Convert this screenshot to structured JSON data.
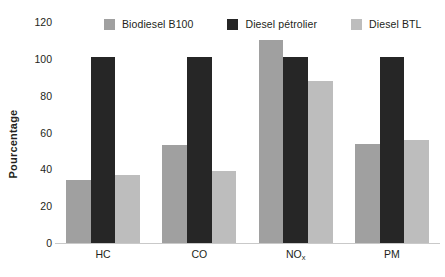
{
  "chart_data": {
    "type": "bar",
    "title": "",
    "subtitle": "",
    "xlabel": "",
    "ylabel": "Pourcentage",
    "ylim": [
      0,
      120
    ],
    "ytick_step": 20,
    "yticks": [
      0,
      20,
      40,
      60,
      80,
      100,
      120
    ],
    "ytick_labels": [
      "0",
      "20",
      "40",
      "60",
      "80",
      "100",
      "120"
    ],
    "grid": false,
    "legend_position": "top",
    "categories": [
      "HC",
      "CO",
      "NOx",
      "PM"
    ],
    "category_labels": [
      "HC",
      "CO",
      "NO",
      "PM"
    ],
    "category_subscripts": [
      "",
      "",
      "x",
      ""
    ],
    "series": [
      {
        "name": "Biodiesel B100",
        "color": "#a0a0a0",
        "values": [
          34,
          53,
          110,
          54
        ]
      },
      {
        "name": "Diesel pétrolier",
        "color": "#262626",
        "values": [
          101,
          101,
          101,
          101
        ]
      },
      {
        "name": "Diesel BTL",
        "color": "#bdbdbd",
        "values": [
          37,
          39,
          88,
          56
        ]
      }
    ]
  },
  "axis": {
    "y_title": "Pourcentage"
  },
  "colors": {
    "background": "#ffffff",
    "text": "#231f20",
    "axis_line": "#c9c9c9",
    "series_1": "#a0a0a0",
    "series_2": "#262626",
    "series_3": "#bdbdbd"
  }
}
